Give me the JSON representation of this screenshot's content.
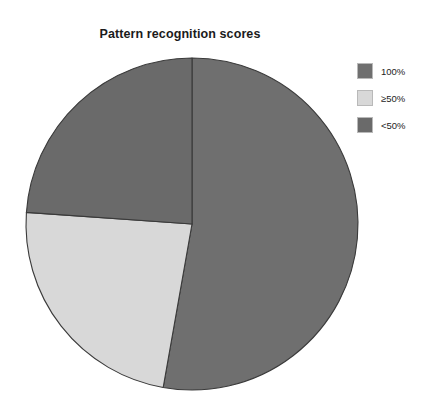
{
  "figure": {
    "background": "#ffffff",
    "title": "Pattern recognition scores"
  },
  "legend": {
    "position": "right",
    "items": [
      {
        "label": "100%",
        "color": "#6f6f6f",
        "swatch_name": "legend-swatch-100"
      },
      {
        "label": "≥50%",
        "color": "#d8d8d8",
        "swatch_name": "legend-swatch-ge50"
      },
      {
        "label": "<50%",
        "color": "#6a6a6a",
        "swatch_name": "legend-swatch-lt50"
      }
    ]
  },
  "chart_data": {
    "type": "pie",
    "title": "Pattern recognition scores",
    "xlabel": "",
    "ylabel": "",
    "grid": false,
    "legend_position": "right",
    "start_angle_deg": 0,
    "direction": "clockwise",
    "categories": [
      "100%",
      "≥50%",
      "<50%"
    ],
    "values": [
      52.8,
      23.3,
      23.9
    ],
    "value_unit": "percent",
    "slice_angles_deg": [
      190.0,
      84.0,
      86.0
    ],
    "colors": [
      "#6f6f6f",
      "#d8d8d8",
      "#6a6a6a"
    ],
    "slice_edge_color": "#3a3a3a",
    "labels_shown": false,
    "geometry": {
      "center_x": 192,
      "center_y": 224,
      "radius": 166
    }
  }
}
